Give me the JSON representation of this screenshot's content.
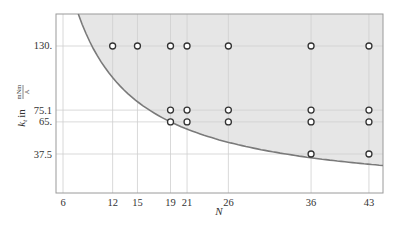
{
  "chart_data": {
    "type": "scatter",
    "title": "",
    "xlabel": "N",
    "ylabel": "k_t in mNm/A",
    "ylabel_parts": {
      "symbol": "k",
      "sub": "t",
      "in": "in",
      "num": "mNm",
      "den": "A"
    },
    "xlim": [
      5.15,
      44.7
    ],
    "ylim": [
      4.1,
      157.4
    ],
    "x_ticks": [
      6,
      12,
      15,
      19,
      21,
      26,
      36,
      43
    ],
    "y_ticks": [
      130,
      75.1,
      65,
      37.5
    ],
    "y_tick_labels": [
      "130.",
      "75.1",
      "65.",
      "37.5"
    ],
    "grid": true,
    "curve": {
      "name": "boundary k = C/N",
      "C": 1235,
      "shaded_region": "above curve"
    },
    "points": [
      {
        "x": 12,
        "y": 130
      },
      {
        "x": 15,
        "y": 130
      },
      {
        "x": 19,
        "y": 130
      },
      {
        "x": 21,
        "y": 130
      },
      {
        "x": 26,
        "y": 130
      },
      {
        "x": 36,
        "y": 130
      },
      {
        "x": 43,
        "y": 130
      },
      {
        "x": 19,
        "y": 75.1
      },
      {
        "x": 21,
        "y": 75.1
      },
      {
        "x": 26,
        "y": 75.1
      },
      {
        "x": 36,
        "y": 75.1
      },
      {
        "x": 43,
        "y": 75.1
      },
      {
        "x": 19,
        "y": 65
      },
      {
        "x": 21,
        "y": 65
      },
      {
        "x": 26,
        "y": 65
      },
      {
        "x": 36,
        "y": 65
      },
      {
        "x": 43,
        "y": 65
      },
      {
        "x": 36,
        "y": 37.5
      },
      {
        "x": 43,
        "y": 37.5
      }
    ]
  },
  "colors": {
    "shade": "#e6e6e6",
    "curve": "#7a7a7a",
    "grid": "#cfcfcf",
    "frame": "#9a9a9a",
    "marker": "#333333"
  }
}
